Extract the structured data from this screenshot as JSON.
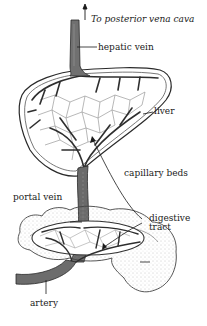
{
  "diagram": {
    "title_arrow_label": "To posterior vena cava",
    "labels": {
      "hepatic_vein": "hepatic vein",
      "liver": "liver",
      "capillary_beds": "capillary beds",
      "portal_vein": "portal vein",
      "digestive_tract_line1": "digestive",
      "digestive_tract_line2": "tract",
      "artery": "artery"
    },
    "colors": {
      "vessel_fill": "#6f6f6f",
      "vessel_outline": "#2a2a2a",
      "capillary": "#8a8a8a",
      "organ_outline": "#333333",
      "stipple": "#9a9a9a",
      "text": "#1a1a1a"
    }
  }
}
